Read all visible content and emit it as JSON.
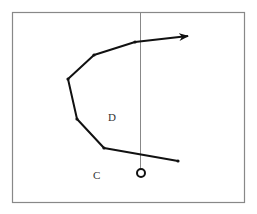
{
  "diagram": {
    "frame": {
      "x": 12,
      "y": 12,
      "width": 233,
      "height": 191,
      "stroke": "#888888"
    },
    "vertical_line": {
      "x": 140,
      "y1": 12,
      "y2": 169,
      "stroke": "#888888"
    },
    "path": {
      "points": [
        [
          178,
          161
        ],
        [
          104,
          148
        ],
        [
          77,
          119
        ],
        [
          68,
          79
        ],
        [
          94,
          55
        ],
        [
          135,
          42
        ],
        [
          190,
          36
        ]
      ],
      "stroke": "#111111",
      "arrow_end": true
    },
    "circle": {
      "cx": 141,
      "cy": 173,
      "r": 4
    },
    "labels": [
      {
        "id": "D",
        "text": "D",
        "x": 110,
        "y": 121
      },
      {
        "id": "C",
        "text": "C",
        "x": 94,
        "y": 179
      }
    ]
  }
}
